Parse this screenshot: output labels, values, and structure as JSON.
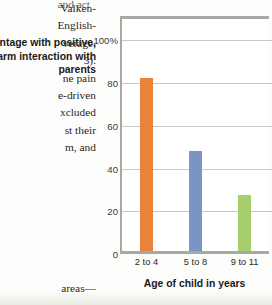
{
  "page": {
    "top_fragment": "and act",
    "bottom_fragment": "areas—",
    "body_lines": [
      "Valken-",
      "English-",
      "verage,",
      "3).",
      "ne pain",
      "e-driven",
      "xcluded",
      "st their",
      "m, and"
    ]
  },
  "chart_data": {
    "type": "bar",
    "title": "",
    "categories": [
      "2 to 4",
      "5 to 8",
      "9 to 11"
    ],
    "values": [
      81,
      47,
      26
    ],
    "xlabel": "Age of child in years",
    "ylabel": "Percentage with positive, warm interaction with parents",
    "ylim": [
      0,
      110
    ],
    "yticks": [
      0,
      20,
      40,
      60,
      80,
      100
    ],
    "ytick_labels": [
      "0",
      "20",
      "40",
      "60",
      "80",
      "100%"
    ],
    "grid": true,
    "legend": "none",
    "bar_colors": [
      "#E8833A",
      "#7A94C4",
      "#A6CE6A"
    ],
    "axis_color": "#A9A9A4",
    "grid_color": "#C9C9C4"
  }
}
